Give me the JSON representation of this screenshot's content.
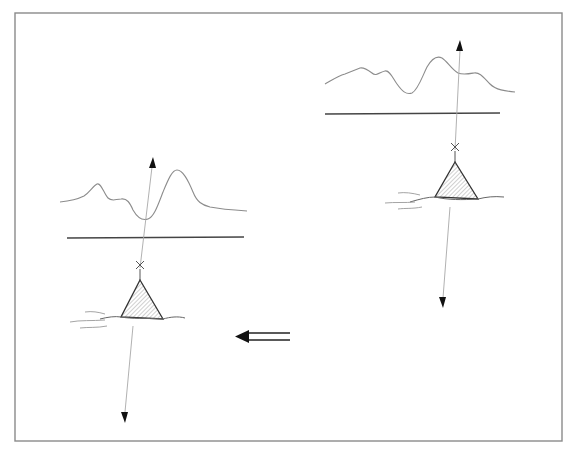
{
  "figure": {
    "type": "schematic-diagram",
    "colors": {
      "frame": "#8a8a8a",
      "profile": "#8c8c8c",
      "reference_line": "#444444",
      "arrowhead": "#111111",
      "hatch": "#777777"
    },
    "panels": [
      {
        "id": "left",
        "label": ""
      },
      {
        "id": "right",
        "label": ""
      }
    ],
    "transition_arrow": {
      "direction": "left",
      "style": "double-line"
    }
  }
}
